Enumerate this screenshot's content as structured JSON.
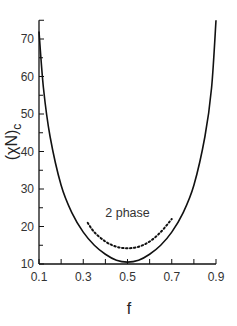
{
  "chart_data": {
    "type": "line",
    "title": "",
    "xlabel": "f",
    "ylabel": "(χN)c",
    "ylabel_main": "(χN)",
    "ylabel_sub": "c",
    "xlim": [
      0.1,
      0.9
    ],
    "ylim": [
      10,
      75
    ],
    "grid": false,
    "legend": null,
    "x_ticks": [
      0.1,
      0.3,
      0.5,
      0.7,
      0.9
    ],
    "x_tick_labels": [
      "0.1",
      "0.3",
      "0.5",
      "0.7",
      "0.9"
    ],
    "x_minor_ticks": [
      0.2,
      0.4,
      0.6,
      0.8
    ],
    "y_ticks": [
      10,
      20,
      30,
      40,
      50,
      60,
      70
    ],
    "y_tick_labels": [
      "10",
      "20",
      "30",
      "40",
      "50",
      "60",
      "70"
    ],
    "y_minor_ticks": [
      15,
      25,
      35,
      45,
      55,
      65
    ],
    "series": [
      {
        "name": "mean-field spinodal (solid)",
        "style": "solid",
        "x": [
          0.1,
          0.12,
          0.15,
          0.2,
          0.25,
          0.3,
          0.35,
          0.4,
          0.45,
          0.5,
          0.55,
          0.6,
          0.65,
          0.7,
          0.75,
          0.8,
          0.85,
          0.88,
          0.9
        ],
        "y": [
          72,
          57,
          44,
          31,
          23.5,
          18.5,
          15,
          12.6,
          11,
          10.5,
          11,
          12.6,
          15,
          18.5,
          23.5,
          31,
          44,
          57,
          75
        ]
      },
      {
        "name": "2 phase boundary (dotted)",
        "style": "dotted",
        "x": [
          0.32,
          0.35,
          0.4,
          0.45,
          0.5,
          0.55,
          0.6,
          0.65,
          0.7
        ],
        "y": [
          21,
          18.5,
          16,
          14.6,
          14.2,
          14.6,
          16,
          18.5,
          22
        ]
      }
    ],
    "annotations": [
      {
        "text": "2 phase",
        "x": 0.5,
        "y": 22.5
      }
    ]
  }
}
